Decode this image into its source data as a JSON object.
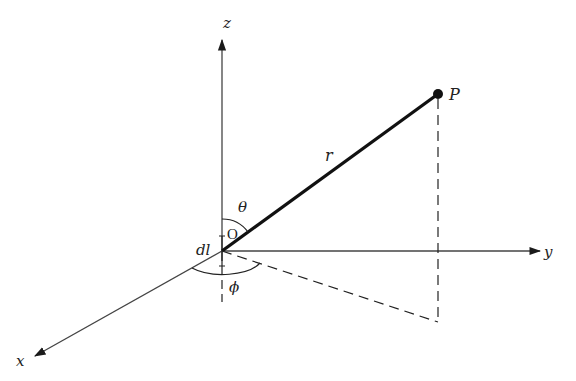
{
  "diagram": {
    "type": "3d-spherical-coordinates",
    "colors": {
      "line": "#1a1a1a",
      "axis": "#333333",
      "background": "#ffffff"
    },
    "labels": {
      "z_axis": "z",
      "y_axis": "y",
      "x_axis": "x",
      "point": "P",
      "radius": "r",
      "origin": "O",
      "theta": "θ",
      "phi": "ϕ",
      "element": "dl"
    },
    "geometry": {
      "origin": [
        222,
        251
      ],
      "z_tip": [
        222,
        38
      ],
      "y_tip": [
        542,
        251
      ],
      "x_tip": [
        33,
        357
      ],
      "point_P": [
        438,
        94
      ],
      "projection_foot": [
        438,
        322
      ]
    }
  }
}
